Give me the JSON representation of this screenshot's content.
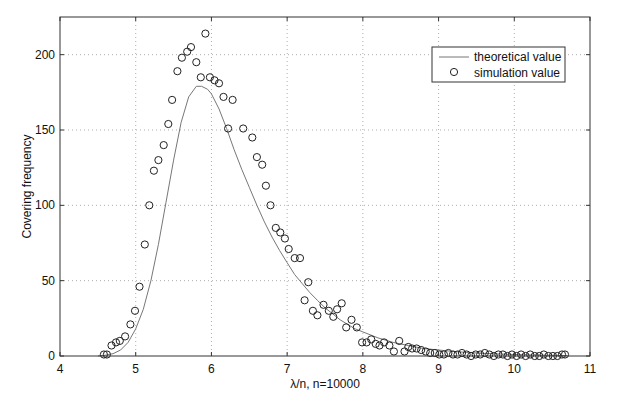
{
  "chart_data": {
    "type": "line",
    "title": "",
    "xlabel": "λ/n, n=10000",
    "ylabel": "Covering frequency",
    "xlim": [
      4,
      11
    ],
    "ylim": [
      0,
      225
    ],
    "xticks": [
      4,
      5,
      6,
      7,
      8,
      9,
      10,
      11
    ],
    "yticks": [
      0,
      50,
      100,
      150,
      200
    ],
    "grid": true,
    "legend_position": "top-right",
    "series": [
      {
        "name": "theoretical value",
        "kind": "line",
        "color": "#777777",
        "x": [
          4.5,
          4.6,
          4.7,
          4.8,
          4.9,
          5.0,
          5.1,
          5.2,
          5.3,
          5.4,
          5.5,
          5.6,
          5.7,
          5.8,
          5.87,
          5.95,
          6.0,
          6.1,
          6.2,
          6.3,
          6.4,
          6.5,
          6.6,
          6.7,
          6.8,
          6.9,
          7.0,
          7.1,
          7.2,
          7.3,
          7.4,
          7.5,
          7.6,
          7.7,
          7.8,
          7.9,
          8.0,
          8.2,
          8.4,
          8.6,
          8.8,
          9.0,
          9.2,
          9.4,
          9.6,
          9.8,
          10.0,
          10.2,
          10.4,
          10.7
        ],
        "y": [
          0,
          0.5,
          1.5,
          4,
          9,
          18,
          31,
          50,
          74,
          102,
          130,
          155,
          172,
          179,
          179,
          177,
          174,
          164,
          151,
          137,
          124,
          112,
          100,
          89,
          79,
          70,
          62,
          54,
          48,
          42,
          37,
          32,
          28,
          24,
          21,
          18,
          16,
          12,
          9,
          7,
          5,
          4,
          3,
          2.3,
          1.7,
          1.3,
          1,
          0.7,
          0.5,
          0.3
        ]
      },
      {
        "name": "simulation value",
        "kind": "scatter",
        "marker": "circle",
        "color": "#222222",
        "points": [
          [
            4.58,
            1
          ],
          [
            4.62,
            1
          ],
          [
            4.68,
            7
          ],
          [
            4.74,
            9
          ],
          [
            4.79,
            10
          ],
          [
            4.86,
            13
          ],
          [
            4.93,
            21
          ],
          [
            4.99,
            30
          ],
          [
            5.05,
            46
          ],
          [
            5.12,
            74
          ],
          [
            5.18,
            100
          ],
          [
            5.24,
            123
          ],
          [
            5.3,
            130
          ],
          [
            5.37,
            140
          ],
          [
            5.43,
            154
          ],
          [
            5.48,
            170
          ],
          [
            5.55,
            189
          ],
          [
            5.61,
            198
          ],
          [
            5.68,
            202
          ],
          [
            5.73,
            205
          ],
          [
            5.8,
            195
          ],
          [
            5.86,
            185
          ],
          [
            5.92,
            214
          ],
          [
            5.98,
            185
          ],
          [
            6.04,
            183
          ],
          [
            6.1,
            181
          ],
          [
            6.16,
            172
          ],
          [
            6.28,
            170
          ],
          [
            6.22,
            151
          ],
          [
            6.42,
            151
          ],
          [
            6.54,
            145
          ],
          [
            6.6,
            132
          ],
          [
            6.67,
            127
          ],
          [
            6.72,
            113
          ],
          [
            6.78,
            100
          ],
          [
            6.85,
            85
          ],
          [
            6.91,
            82
          ],
          [
            6.97,
            78
          ],
          [
            7.02,
            71
          ],
          [
            7.1,
            65
          ],
          [
            7.17,
            65
          ],
          [
            7.23,
            37
          ],
          [
            7.28,
            49
          ],
          [
            7.34,
            30
          ],
          [
            7.4,
            27
          ],
          [
            7.48,
            34
          ],
          [
            7.55,
            30
          ],
          [
            7.61,
            26
          ],
          [
            7.66,
            31
          ],
          [
            7.72,
            35
          ],
          [
            7.78,
            19
          ],
          [
            7.85,
            24
          ],
          [
            7.92,
            19
          ],
          [
            7.99,
            9
          ],
          [
            8.05,
            9
          ],
          [
            8.11,
            11
          ],
          [
            8.17,
            8
          ],
          [
            8.22,
            7
          ],
          [
            8.28,
            9
          ],
          [
            8.35,
            7
          ],
          [
            8.41,
            3
          ],
          [
            8.48,
            10
          ],
          [
            8.55,
            3
          ],
          [
            8.6,
            6
          ],
          [
            8.65,
            5
          ],
          [
            8.71,
            5
          ],
          [
            8.77,
            4
          ],
          [
            8.83,
            3
          ],
          [
            8.89,
            2
          ],
          [
            8.95,
            2
          ],
          [
            9.01,
            1
          ],
          [
            9.07,
            1
          ],
          [
            9.13,
            2
          ],
          [
            9.19,
            1
          ],
          [
            9.25,
            1
          ],
          [
            9.31,
            2
          ],
          [
            9.37,
            1
          ],
          [
            9.43,
            0
          ],
          [
            9.49,
            1
          ],
          [
            9.55,
            1
          ],
          [
            9.61,
            2
          ],
          [
            9.67,
            1
          ],
          [
            9.73,
            0
          ],
          [
            9.79,
            1
          ],
          [
            9.85,
            1
          ],
          [
            9.91,
            0
          ],
          [
            9.97,
            1
          ],
          [
            10.03,
            0
          ],
          [
            10.09,
            1
          ],
          [
            10.15,
            0
          ],
          [
            10.21,
            1
          ],
          [
            10.27,
            0
          ],
          [
            10.33,
            0
          ],
          [
            10.39,
            1
          ],
          [
            10.45,
            0
          ],
          [
            10.51,
            0
          ],
          [
            10.57,
            0
          ],
          [
            10.63,
            1
          ],
          [
            10.67,
            1
          ]
        ]
      }
    ]
  }
}
